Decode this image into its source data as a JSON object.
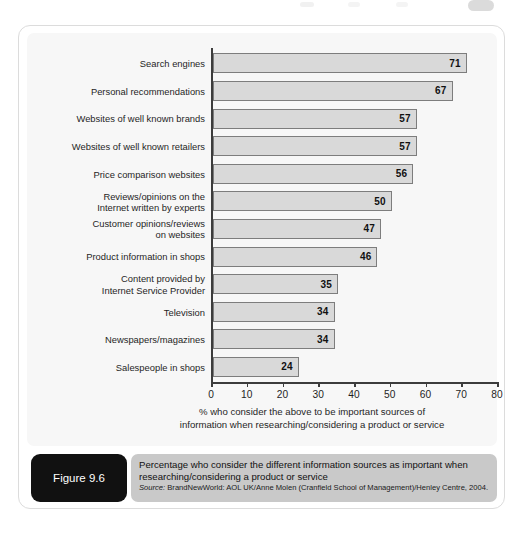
{
  "figure": {
    "tag_label": "Figure 9.6",
    "caption_title": "Percentage who consider the different information sources as important when researching/considering a product or service",
    "source_prefix": "Source:",
    "source_text": " BrandNewWorld: AOL UK/Anne Molen (Cranfield School of Management)/Henley Centre, 2004."
  },
  "axis": {
    "caption_line1": "% who consider the above to be important sources of",
    "caption_line2": "information when researching/considering a product or service"
  },
  "chart_data": {
    "type": "bar",
    "orientation": "horizontal",
    "title": "Percentage who consider the different information sources as important when researching/considering a product or service",
    "xlabel": "% who consider the above to be important sources of information when researching/considering a product or service",
    "ylabel": "",
    "xlim": [
      0,
      80
    ],
    "xticks": [
      0,
      10,
      20,
      30,
      40,
      50,
      60,
      70,
      80
    ],
    "xtick_labels": [
      "0",
      "10",
      "20",
      "30",
      "40",
      "50",
      "60",
      "70",
      "80"
    ],
    "grid": false,
    "legend": "none",
    "data_labels": true,
    "bar_fill": "#d9d9d9",
    "bar_edge": "#7d7d7d",
    "categories": [
      "Search engines",
      "Personal recommendations",
      "Websites of well known brands",
      "Websites of well known retailers",
      "Price comparison websites",
      "Reviews/opinions on the\nInternet written by experts",
      "Customer opinions/reviews\non websites",
      "Product information in shops",
      "Content provided by\nInternet Service Provider",
      "Television",
      "Newspapers/magazines",
      "Salespeople in shops"
    ],
    "values": [
      71,
      67,
      57,
      57,
      56,
      50,
      47,
      46,
      35,
      34,
      34,
      24
    ],
    "value_labels": [
      "71",
      "67",
      "57",
      "57",
      "56",
      "50",
      "47",
      "46",
      "35",
      "34",
      "34",
      "24"
    ]
  }
}
